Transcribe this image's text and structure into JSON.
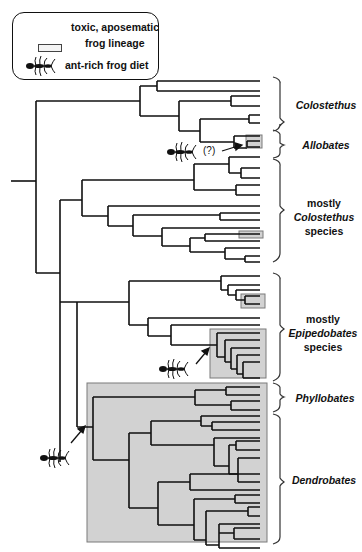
{
  "legend": {
    "toxic_label_line1": "toxic, aposematic",
    "toxic_label_line2": "frog lineage",
    "ant_label": "ant-rich frog diet"
  },
  "annotations": {
    "uncertain_marker": "(?)"
  },
  "clades": [
    {
      "id": "colostethus",
      "label": "Colostethus",
      "italic": true
    },
    {
      "id": "allobates",
      "label": "Allobates",
      "italic": true
    },
    {
      "id": "mostly-colostethus",
      "line1": "mostly",
      "line2": "Colostethus",
      "line3": "species"
    },
    {
      "id": "mostly-epipedobates",
      "line1": "mostly",
      "line2": "Epipedobates",
      "line3": "species"
    },
    {
      "id": "phyllobates",
      "label": "Phyllobates",
      "italic": true
    },
    {
      "id": "dendrobates",
      "label": "Dendrobates",
      "italic": true
    }
  ],
  "colors": {
    "line": "#111111",
    "highlight_fill": "#cfcfcf",
    "highlight_border": "#777777"
  }
}
